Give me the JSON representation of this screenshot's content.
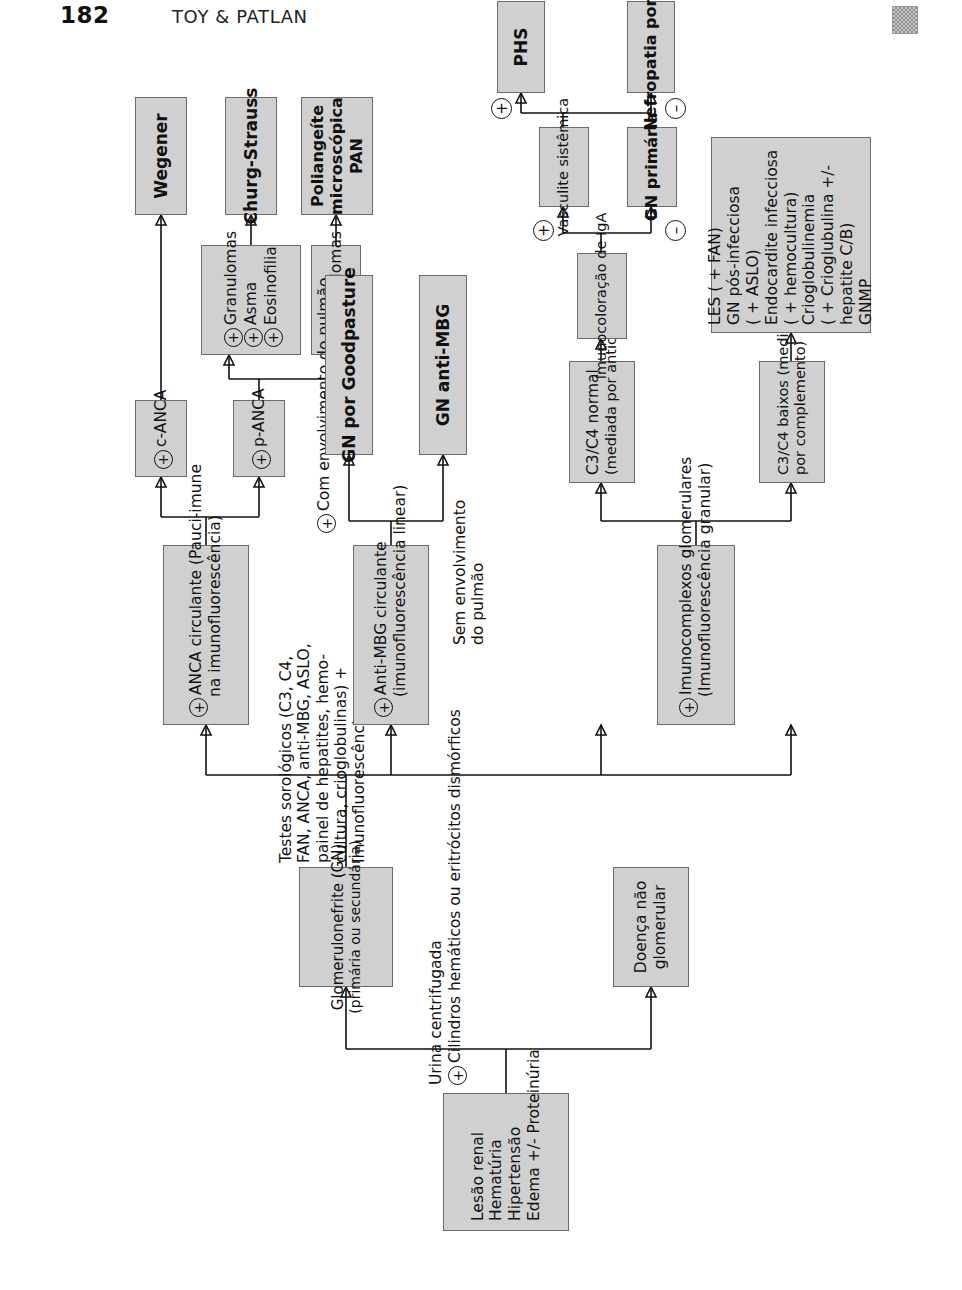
{
  "page": {
    "number": "182",
    "running_head": "TOY & PATLAN",
    "corner_mark_icon": "checkered-square-icon"
  },
  "flowchart": {
    "title": "Abordagem diagnóstica da glomerulonefrite",
    "symbols": {
      "positive": "+",
      "negative": "–"
    },
    "nodes": {
      "presentation": {
        "lines": [
          "Lesão renal",
          "Hematúria",
          "Hipertensão",
          "Edema +/- Proteinúria"
        ]
      },
      "urine_test": {
        "line1": "Urina centrifugada",
        "line2_sign": "+",
        "line2": "Cilindros hemáticos ou eritrócitos dismórficos"
      },
      "branch_yes": "Sim",
      "branch_no": "Não",
      "non_glomerular": {
        "lines": [
          "Doença não",
          "glomerular"
        ]
      },
      "gn": {
        "line1": "Glomerulonefrite (GN)",
        "line2": "(primária ou secundária)"
      },
      "serology": {
        "lines": [
          "Testes sorológicos (C3, C4,",
          "FAN, ANCA, anti-MBG, ASLO,",
          "painel de hepatites, hemo-",
          "cultura, crioglobulinas) +",
          "Imunofluorescência"
        ]
      },
      "anca": {
        "sign": "+",
        "line1": "ANCA circulante (Pauci-imune",
        "line2": "na imunofluorescência)"
      },
      "c_anca": {
        "sign": "+",
        "label": "c-ANCA"
      },
      "p_anca": {
        "sign": "+",
        "label": "p-ANCA"
      },
      "granulomas_triple": {
        "rows": [
          {
            "sign": "+",
            "label": "Granulomas"
          },
          {
            "sign": "+",
            "label": "Asma"
          },
          {
            "sign": "+",
            "label": "Eosinofilia"
          }
        ]
      },
      "granulomas_neg": {
        "sign": "–",
        "label": "Granulomas"
      },
      "wegener": {
        "label": "Wegener"
      },
      "churg_strauss": {
        "label": "Churg-Strauss"
      },
      "pan": {
        "lines": [
          "Poliangeíte",
          "microscópica",
          "PAN"
        ]
      },
      "anti_mbg": {
        "sign": "+",
        "line1": "Anti-MBG circulante",
        "line2": "(imunofluorescência linear)"
      },
      "lung_yes": {
        "sign": "+",
        "line1": "Com envolvimento do pulmão"
      },
      "lung_no": {
        "lines": [
          "Sem envolvimento",
          "do pulmão"
        ]
      },
      "goodpasture": {
        "label": "GN por Goodpasture"
      },
      "gn_anti_mbg": {
        "label": "GN anti-MBG"
      },
      "immune_complex": {
        "sign": "+",
        "line1": "Imunocomplexos glomerulares",
        "line2": "(Imunofluorescência granular)"
      },
      "c3c4_normal": {
        "line1": "C3/C4 normal",
        "line2": "(mediada por anticorpo)"
      },
      "c3c4_low": {
        "line1": "C3/C4 baixos (mediada",
        "line2": "por complemento)"
      },
      "iga_stain": {
        "label": "Imunocoloração de IgA"
      },
      "systemic_vasculitis": {
        "label": "Vasculite sistêmica"
      },
      "gn_primary": {
        "label": "GN primária"
      },
      "phs": {
        "label": "PHS"
      },
      "iga_nephropathy": {
        "label": "Nefropatia por IgA"
      },
      "low_complement_causes": {
        "lines": [
          {
            "text": "LES ( + FAN)",
            "bold": true
          },
          {
            "text": "GN pós-infecciosa",
            "bold": true
          },
          {
            "text": "( + ASLO)",
            "bold": false
          },
          {
            "text": "Endocardite infecciosa",
            "bold": true
          },
          {
            "text": "( + hemocultura)",
            "bold": false
          },
          {
            "text": "Crioglobulinemia",
            "bold": true
          },
          {
            "text": "( + Crioglubulina +/-",
            "bold": false
          },
          {
            "text": "hepatite C/B)",
            "bold": false
          },
          {
            "text": "GNMP",
            "bold": true
          }
        ]
      }
    },
    "edge_signs": {
      "anti_mbg_lung_pos": "+",
      "iga_pos": "+",
      "iga_neg": "–",
      "vasculitis_pos": "+",
      "vasculitis_neg": "–"
    },
    "colors": {
      "node_fill": "#d0d0d0",
      "node_border": "#6b6b6b",
      "text": "#111111",
      "page_background": "#ffffff"
    }
  }
}
